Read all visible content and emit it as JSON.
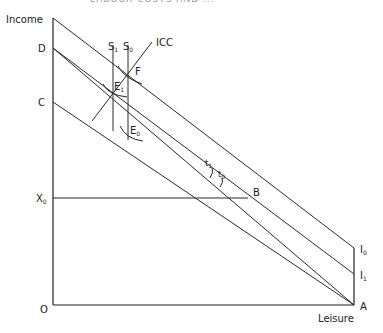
{
  "header": {
    "partial_title": "LABOUR COSTS AND ..."
  },
  "diagram": {
    "axes": {
      "y_label": "Income",
      "x_label": "Leisure",
      "origin": "O"
    },
    "y_points": {
      "D": "D",
      "C": "C",
      "X0": "X",
      "X0_sub": "0"
    },
    "right_points": {
      "I0": "I",
      "I0_sub": "0",
      "I1": "I",
      "I1_sub": "1",
      "A": "A"
    },
    "verticals": {
      "S1": "S",
      "S1_sub": "1",
      "S0": "S",
      "S0_sub": "0"
    },
    "curve_label": "ICC",
    "points": {
      "F": "F",
      "E1": "E",
      "E1_sub": "1",
      "E0": "E",
      "E0_sub": "0",
      "B": "B"
    },
    "angles": {
      "t1": "t",
      "t1_sub": "1",
      "t0": "t",
      "t0_sub": "0"
    }
  }
}
